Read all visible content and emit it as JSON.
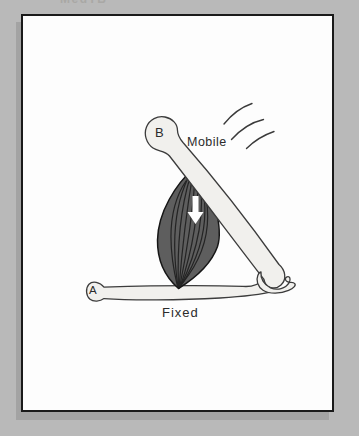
{
  "window": {
    "watermark": "MedTB"
  },
  "diagram": {
    "labels": {
      "point_b": "B",
      "point_a": "A",
      "mobile_bone": "Mobile",
      "fixed_bone": "Fixed"
    },
    "colors": {
      "background": "#b9b9b9",
      "panel": "#fdfdfd",
      "panel_border": "#1a1a1a",
      "panel_shadow": "#a3a3a3",
      "bone_fill": "#f1f0ed",
      "bone_outline": "#3c3c3c",
      "muscle_fill": "#5e5e5e",
      "muscle_striation": "#1e1e1e",
      "muscle_outline": "#161616",
      "contraction_arrow": "#ffffff",
      "motion_lines": "#3a3a3a",
      "label_text": "#2b2b2b"
    },
    "icons": {
      "contraction_arrow": "down-arrow-icon",
      "movement_marks": "motion-lines-icon"
    }
  }
}
